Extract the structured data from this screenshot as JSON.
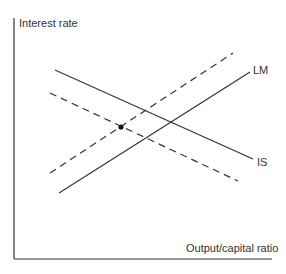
{
  "diagram": {
    "type": "IS-LM diagram",
    "y_axis_label": "Interest rate",
    "x_axis_label": "Output/capital ratio",
    "curves": [
      {
        "name": "IS",
        "label": "IS",
        "style": "solid",
        "slope": "downward",
        "from": [
          55,
          70
        ],
        "to": [
          253,
          159
        ]
      },
      {
        "name": "IS-shifted",
        "label": "",
        "style": "dashed",
        "slope": "downward",
        "from": [
          50,
          93
        ],
        "to": [
          238,
          181
        ]
      },
      {
        "name": "LM",
        "label": "LM",
        "style": "solid",
        "slope": "upward",
        "from": [
          59,
          193
        ],
        "to": [
          250,
          72
        ]
      },
      {
        "name": "LM-shifted",
        "label": "",
        "style": "dashed",
        "slope": "upward",
        "from": [
          50,
          173
        ],
        "to": [
          233,
          53
        ]
      }
    ],
    "equilibrium_point": {
      "marker": "dot",
      "at": [
        121,
        127
      ],
      "note": "intersection of dashed IS and dashed LM"
    },
    "colors": {
      "line": "#333333",
      "background": "#ffffff"
    }
  }
}
